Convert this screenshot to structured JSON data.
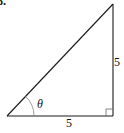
{
  "problem": {
    "number": "8."
  },
  "triangle": {
    "type": "right-triangle",
    "sides": {
      "base_label": "5",
      "height_label": "5"
    },
    "angle_label": "θ",
    "right_angle_marker": true,
    "stroke_color": "#1a1a1a",
    "arc_color": "#888888"
  }
}
